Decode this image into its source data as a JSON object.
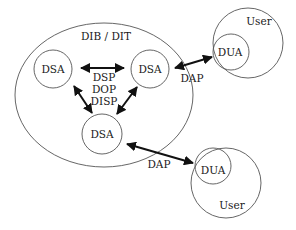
{
  "diagram": {
    "directory_label": "DIB / DIT",
    "nodes": {
      "dsa_left": "DSA",
      "dsa_right": "DSA",
      "dsa_bottom": "DSA",
      "dua_top": "DUA",
      "dua_bottom": "DUA"
    },
    "users": {
      "top": "User",
      "bottom": "User"
    },
    "protocols": {
      "inter_dsa": [
        "DSP",
        "DOP",
        "DISP"
      ],
      "dap_top": "DAP",
      "dap_bottom": "DAP"
    },
    "colors": {
      "stroke": "#555555",
      "arrow": "#111111",
      "text": "#1a1a1a"
    }
  }
}
